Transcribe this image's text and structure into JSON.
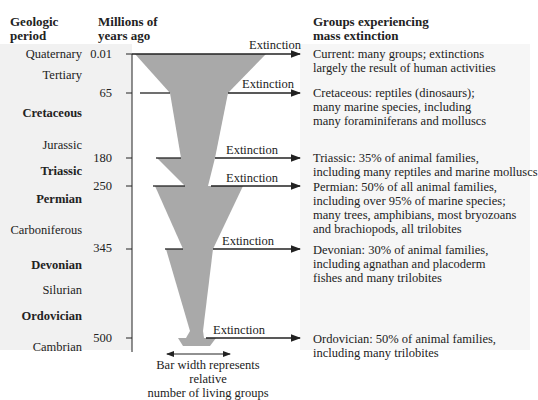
{
  "headers": {
    "period": [
      "Geologic",
      "period"
    ],
    "mya": [
      "Millions of",
      "years ago"
    ],
    "groups": [
      "Groups experiencing",
      "mass extinction"
    ]
  },
  "periods": [
    {
      "name": "Quaternary",
      "bold": false
    },
    {
      "name": "Tertiary",
      "bold": false
    },
    {
      "name": "Cretaceous",
      "bold": true
    },
    {
      "name": "Jurassic",
      "bold": false
    },
    {
      "name": "Triassic",
      "bold": true
    },
    {
      "name": "Permian",
      "bold": true
    },
    {
      "name": "Carboniferous",
      "bold": false
    },
    {
      "name": "Devonian",
      "bold": true
    },
    {
      "name": "Silurian",
      "bold": false
    },
    {
      "name": "Ordovician",
      "bold": true
    },
    {
      "name": "Cambrian",
      "bold": false
    }
  ],
  "ticks": [
    "0.01",
    "65",
    "180",
    "250",
    "345",
    "500"
  ],
  "extinction_label": "Extinction",
  "extinctions": [
    {
      "tick": "0.01",
      "lines": [
        "Current: many groups; extinctions",
        "largely the result of human activities"
      ]
    },
    {
      "tick": "65",
      "lines": [
        "Cretaceous: reptiles (dinosaurs);",
        "many marine species, including",
        "many foraminiferans and molluscs"
      ]
    },
    {
      "tick": "180",
      "lines": [
        "Triassic: 35% of animal families,",
        "including many reptiles and marine molluscs"
      ]
    },
    {
      "tick": "250",
      "lines": [
        "Permian: 50% of all animal families,",
        "including over 95% of marine species;",
        "many trees, amphibians, most bryozoans",
        "and brachiopods, all trilobites"
      ]
    },
    {
      "tick": "345",
      "lines": [
        "Devonian: 30% of animal families,",
        "including agnathan and placoderm",
        "fishes and many trilobites"
      ]
    },
    {
      "tick": "500",
      "lines": [
        "Ordovician: 50% of animal families,",
        "including many trilobites"
      ]
    }
  ],
  "caption": [
    "Bar width represents relative",
    "number of living groups"
  ],
  "colors": {
    "funnel": "#a9a9a9",
    "line": "#222222",
    "panel": "#f1f1f1"
  }
}
